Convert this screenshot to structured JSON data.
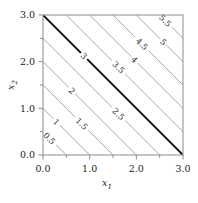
{
  "figure": {
    "background_color": "#ffffff",
    "frame_color": "#8c8c8c",
    "footer_caption": ""
  },
  "axes": {
    "xlabel": "x",
    "xlabel_sub": "1",
    "ylabel": "x",
    "ylabel_sub": "2",
    "xticks": [
      "0.0",
      "1.0",
      "2.0",
      "3.0"
    ],
    "yticks": [
      "0.0",
      "1.0",
      "2.0",
      "3.0"
    ],
    "xlim": [
      0,
      3
    ],
    "ylim": [
      0,
      3
    ],
    "minor_tick_step": 0.5,
    "grid": false
  },
  "chart_data": {
    "type": "line",
    "chart_subtype": "contour",
    "title": "",
    "xlabel": "x1",
    "ylabel": "x2",
    "xlim": [
      0,
      3
    ],
    "ylim": [
      0,
      3
    ],
    "grid": false,
    "legend": "none",
    "function": "f(x1,x2) = x1 + x2",
    "contour_levels": [
      0.5,
      1,
      1.5,
      2,
      2.5,
      3,
      3.5,
      4,
      4.5,
      5,
      5.5
    ],
    "highlighted_level": 3,
    "line_color": "#a6a6a6",
    "highlight_color": "#000000",
    "contours": [
      {
        "level": "0.5",
        "value": 0.5,
        "p1": [
          0.0,
          0.5
        ],
        "p2": [
          0.5,
          0.0
        ],
        "label_at": [
          0.14,
          0.36
        ],
        "highlight": false
      },
      {
        "level": "1",
        "value": 1.0,
        "p1": [
          0.0,
          1.0
        ],
        "p2": [
          1.0,
          0.0
        ],
        "label_at": [
          0.29,
          0.71
        ],
        "highlight": false
      },
      {
        "level": "1.5",
        "value": 1.5,
        "p1": [
          0.0,
          1.5
        ],
        "p2": [
          1.5,
          0.0
        ],
        "label_at": [
          0.83,
          0.67
        ],
        "highlight": false
      },
      {
        "level": "2",
        "value": 2.0,
        "p1": [
          0.0,
          2.0
        ],
        "p2": [
          2.0,
          0.0
        ],
        "label_at": [
          0.62,
          1.38
        ],
        "highlight": false
      },
      {
        "level": "2.5",
        "value": 2.5,
        "p1": [
          0.0,
          2.5
        ],
        "p2": [
          2.5,
          0.0
        ],
        "label_at": [
          1.62,
          0.88
        ],
        "highlight": false
      },
      {
        "level": "3",
        "value": 3.0,
        "p1": [
          0.0,
          3.0
        ],
        "p2": [
          3.0,
          0.0
        ],
        "label_at": [
          0.88,
          2.12
        ],
        "highlight": true
      },
      {
        "level": "3.5",
        "value": 3.5,
        "p1": [
          0.5,
          3.0
        ],
        "p2": [
          3.0,
          0.5
        ],
        "label_at": [
          1.62,
          1.88
        ],
        "highlight": false
      },
      {
        "level": "4",
        "value": 4.0,
        "p1": [
          1.0,
          3.0
        ],
        "p2": [
          3.0,
          1.0
        ],
        "label_at": [
          1.96,
          2.04
        ],
        "highlight": false
      },
      {
        "level": "4.5",
        "value": 4.5,
        "p1": [
          1.5,
          3.0
        ],
        "p2": [
          3.0,
          1.5
        ],
        "label_at": [
          2.12,
          2.38
        ],
        "highlight": false
      },
      {
        "level": "5",
        "value": 5.0,
        "p1": [
          2.0,
          3.0
        ],
        "p2": [
          3.0,
          2.0
        ],
        "label_at": [
          2.58,
          2.42
        ],
        "highlight": false
      },
      {
        "level": "5.5",
        "value": 5.5,
        "p1": [
          2.5,
          3.0
        ],
        "p2": [
          3.0,
          2.5
        ],
        "label_at": [
          2.62,
          2.88
        ],
        "highlight": false
      }
    ]
  }
}
